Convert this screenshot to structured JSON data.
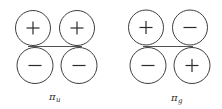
{
  "figure": {
    "background_color": "#ffffff",
    "line_color": "#3e3e3e",
    "sign_color": "#2b2b2b",
    "diagrams": [
      {
        "id": "pi-u",
        "label": "π",
        "label_subscript": "u",
        "axis_line": {
          "x1": 28,
          "y1": 46.5,
          "x2": 82,
          "y2": 46.5
        },
        "lobes": [
          {
            "cx": 33,
            "cy": 28,
            "r": 17.5,
            "sign": "+",
            "position": "top-left"
          },
          {
            "cx": 77,
            "cy": 28,
            "r": 17.5,
            "sign": "+",
            "position": "top-right"
          },
          {
            "cx": 35,
            "cy": 65.5,
            "r": 18,
            "sign": "−",
            "position": "bottom-left"
          },
          {
            "cx": 79,
            "cy": 65.5,
            "r": 18,
            "sign": "−",
            "position": "bottom-right"
          }
        ]
      },
      {
        "id": "pi-g",
        "label": "π",
        "label_subscript": "g",
        "axis_line": {
          "x1": 143,
          "y1": 46.5,
          "x2": 193,
          "y2": 46.5
        },
        "lobes": [
          {
            "cx": 146,
            "cy": 27.5,
            "r": 17.5,
            "sign": "+",
            "position": "top-left"
          },
          {
            "cx": 190,
            "cy": 27.5,
            "r": 17.5,
            "sign": "−",
            "position": "top-right"
          },
          {
            "cx": 148,
            "cy": 65.5,
            "r": 18,
            "sign": "−",
            "position": "bottom-left"
          },
          {
            "cx": 192,
            "cy": 65.5,
            "r": 18,
            "sign": "+",
            "position": "bottom-right"
          }
        ]
      }
    ],
    "sign_half_length": 6.5
  }
}
